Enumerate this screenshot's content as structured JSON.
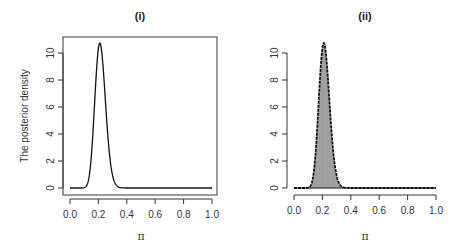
{
  "chart_data": [
    {
      "type": "line",
      "title": "(i)",
      "xlabel": "π",
      "ylabel": "The posterior density",
      "xlim": [
        0,
        1
      ],
      "ylim": [
        0,
        11
      ],
      "xticks": [
        "0.0",
        "0.2",
        "0.4",
        "0.6",
        "0.8",
        "1.0"
      ],
      "yticks": [
        "0",
        "2",
        "4",
        "6",
        "8",
        "10"
      ],
      "grid": false,
      "box": true,
      "series": [
        {
          "name": "posterior density",
          "x": [
            0.0,
            0.05,
            0.1,
            0.12,
            0.14,
            0.16,
            0.18,
            0.2,
            0.21,
            0.22,
            0.24,
            0.26,
            0.28,
            0.3,
            0.32,
            0.35,
            0.4,
            0.5,
            1.0
          ],
          "y": [
            0.0,
            0.0,
            0.1,
            0.5,
            1.6,
            3.9,
            7.1,
            10.0,
            10.7,
            10.5,
            8.6,
            5.6,
            3.0,
            1.3,
            0.5,
            0.1,
            0.0,
            0.0,
            0.0
          ]
        }
      ]
    },
    {
      "type": "bar",
      "title": "(ii)",
      "xlabel": "π",
      "ylabel": "",
      "xlim": [
        0,
        1
      ],
      "ylim": [
        0,
        11
      ],
      "xticks": [
        "0.0",
        "0.2",
        "0.4",
        "0.6",
        "0.8",
        "1.0"
      ],
      "yticks": [
        "0",
        "2",
        "4",
        "6",
        "8",
        "10"
      ],
      "grid": false,
      "box": false,
      "description": "Histogram of posterior samples (fine gray bars) with overlaid posterior density curve",
      "series": [
        {
          "name": "posterior density",
          "x": [
            0.0,
            0.05,
            0.1,
            0.12,
            0.14,
            0.16,
            0.18,
            0.2,
            0.21,
            0.22,
            0.24,
            0.26,
            0.28,
            0.3,
            0.32,
            0.35,
            0.4,
            0.5,
            1.0
          ],
          "y": [
            0.0,
            0.0,
            0.1,
            0.5,
            1.6,
            3.9,
            7.1,
            10.0,
            10.7,
            10.5,
            8.6,
            5.6,
            3.0,
            1.3,
            0.5,
            0.1,
            0.0,
            0.0,
            0.0
          ]
        }
      ]
    }
  ],
  "panels": {
    "left": {
      "title": "(i)",
      "ylabel": "The posterior density",
      "xlabel": "π",
      "xticks": [
        "0.0",
        "0.2",
        "0.4",
        "0.6",
        "0.8",
        "1.0"
      ],
      "yticks": [
        "0",
        "2",
        "4",
        "6",
        "8",
        "10"
      ]
    },
    "right": {
      "title": "(ii)",
      "xlabel": "π",
      "xticks": [
        "0.0",
        "0.2",
        "0.4",
        "0.6",
        "0.8",
        "1.0"
      ],
      "yticks": [
        "0",
        "2",
        "4",
        "6",
        "8",
        "10"
      ]
    }
  },
  "colors": {
    "line": "#111111",
    "bar_fill": "#666666",
    "bar_stripe": "#bdbdbd",
    "axis": "#333333"
  }
}
